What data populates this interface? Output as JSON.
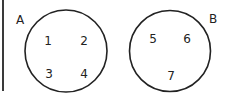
{
  "diagram": {
    "type": "set-diagram",
    "sets": [
      {
        "label": "A",
        "elements": [
          "1",
          "2",
          "3",
          "4"
        ]
      },
      {
        "label": "B",
        "elements": [
          "5",
          "6",
          "7"
        ]
      }
    ],
    "colors": {
      "stroke": "#222222",
      "background": "#ffffff"
    }
  }
}
